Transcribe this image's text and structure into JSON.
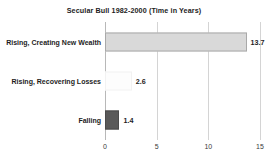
{
  "chart_data": {
    "type": "bar",
    "orientation": "horizontal",
    "title": "Secular Bull 1982-2000 (Time in Years)",
    "xlabel": "",
    "ylabel": "",
    "categories": [
      "Rising, Creating New Wealth",
      "Rising, Recovering Losses",
      "Falling"
    ],
    "values": [
      13.7,
      2.6,
      1.4
    ],
    "value_labels": [
      "13.7",
      "2.6",
      "1.4"
    ],
    "xlim": [
      0,
      15
    ],
    "xticks": [
      0,
      5,
      10,
      15
    ],
    "xtick_labels": [
      "0",
      "5",
      "10",
      "15"
    ],
    "grid": true,
    "grid_axis": "x",
    "legend": false,
    "bar_colors": [
      "#d9d9d9",
      "#fdfdfd",
      "#595959"
    ],
    "bar_border_colors": [
      "#a9a9a9",
      "#f2f2f2",
      "#4a4a4a"
    ],
    "gridline_color": "#d4d4d4",
    "axis_color": "#b8b8b8",
    "text_color": "#1d1d1d"
  }
}
